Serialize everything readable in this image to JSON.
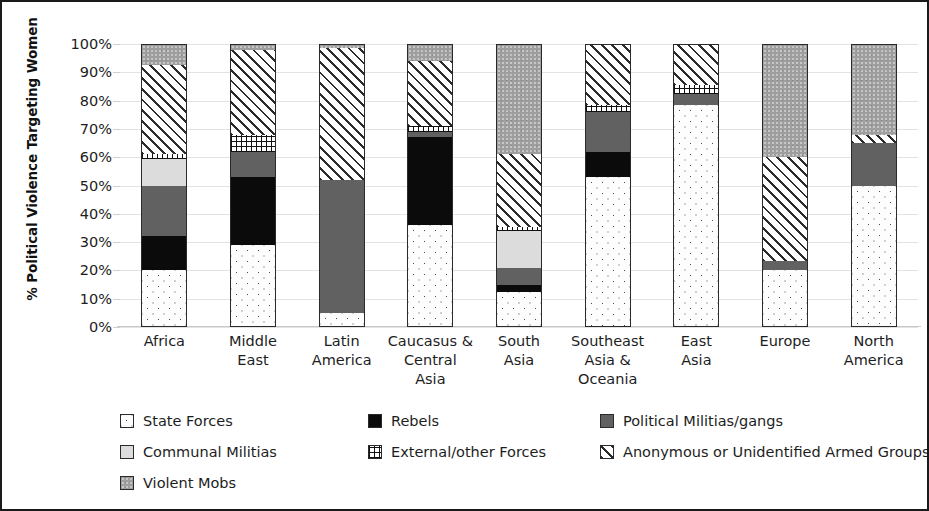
{
  "chart_data": {
    "type": "bar",
    "subtype": "stacked-100-percent",
    "title": "",
    "xlabel": "",
    "ylabel": "% Political Violence Targeting Women",
    "ylim": [
      0,
      100
    ],
    "ytick_labels": [
      "0%",
      "10%",
      "20%",
      "30%",
      "40%",
      "50%",
      "60%",
      "70%",
      "80%",
      "90%",
      "100%"
    ],
    "ytick_values": [
      0,
      10,
      20,
      30,
      40,
      50,
      60,
      70,
      80,
      90,
      100
    ],
    "grid": true,
    "legend_position": "bottom",
    "categories": [
      "Africa",
      "Middle East",
      "Latin America",
      "Caucasus & Central Asia",
      "South Asia",
      "Southeast Asia & Oceania",
      "East Asia",
      "Europe",
      "North America"
    ],
    "category_lines": [
      [
        "Africa"
      ],
      [
        "Middle",
        "East"
      ],
      [
        "Latin",
        "America"
      ],
      [
        "Caucasus &",
        "Central",
        "Asia"
      ],
      [
        "South",
        "Asia"
      ],
      [
        "Southeast",
        "Asia &",
        "Oceania"
      ],
      [
        "East",
        "Asia"
      ],
      [
        "Europe"
      ],
      [
        "North",
        "America"
      ]
    ],
    "series": [
      {
        "name": "State Forces",
        "key": "state",
        "pattern": "dotted-white",
        "values": [
          20,
          29,
          5,
          36,
          12.5,
          53,
          78.5,
          20,
          50
        ]
      },
      {
        "name": "Rebels",
        "key": "rebels",
        "pattern": "solid-black",
        "values": [
          12,
          24,
          0,
          31,
          2.5,
          9,
          0,
          0,
          0
        ]
      },
      {
        "name": "Political Militias/gangs",
        "key": "polmil",
        "pattern": "solid-dark-grey",
        "values": [
          18,
          9,
          47,
          2,
          6,
          14,
          4,
          3.5,
          15
        ]
      },
      {
        "name": "Communal Militias",
        "key": "communal",
        "pattern": "solid-light-grey",
        "values": [
          9.5,
          0,
          0,
          0,
          13,
          0,
          0,
          0,
          0
        ]
      },
      {
        "name": "External/other Forces",
        "key": "external",
        "pattern": "crosshatch-grid",
        "values": [
          1.5,
          6,
          0,
          2,
          1.5,
          2.5,
          3,
          0,
          0
        ]
      },
      {
        "name": "Anonymous or Unidentified Armed Groups",
        "key": "anonymous",
        "pattern": "diagonal-hatch",
        "values": [
          31.5,
          30,
          46.5,
          23,
          25.5,
          21,
          14.5,
          36.5,
          3
        ]
      },
      {
        "name": "Violent Mobs",
        "key": "mobs",
        "pattern": "speckled-mid-grey",
        "values": [
          7.5,
          2,
          1.5,
          6,
          39,
          0.5,
          0,
          40,
          32
        ]
      }
    ]
  },
  "legend": {
    "items": [
      {
        "label": "State Forces",
        "key": "state"
      },
      {
        "label": "Rebels",
        "key": "rebels"
      },
      {
        "label": "Political Militias/gangs",
        "key": "polmil"
      },
      {
        "label": "Communal Militias",
        "key": "communal"
      },
      {
        "label": "External/other Forces",
        "key": "external"
      },
      {
        "label": "Anonymous or Unidentified Armed Groups",
        "key": "anonymous"
      },
      {
        "label": "Violent Mobs",
        "key": "mobs"
      }
    ],
    "layout": [
      [
        {
          "index": 0,
          "left": 0
        },
        {
          "index": 1,
          "left": 248
        },
        {
          "index": 2,
          "left": 480
        }
      ],
      [
        {
          "index": 3,
          "left": 0
        },
        {
          "index": 4,
          "left": 248
        },
        {
          "index": 5,
          "left": 480
        }
      ],
      [
        {
          "index": 6,
          "left": 0
        }
      ]
    ]
  }
}
